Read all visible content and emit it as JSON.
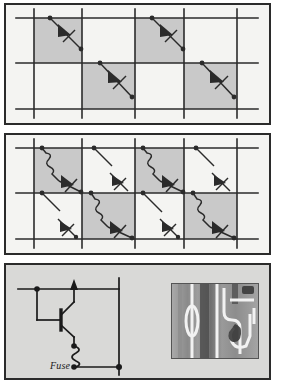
{
  "figure": {
    "title": "",
    "panels": [
      {
        "id": "panel-a",
        "name": "diode-array-grid-top",
        "description": "Rectangular grid of conductor lines with shaded cells, each crossed by a diagonal branch containing a diode symbol",
        "background_color": "#f4f4f2",
        "border_color": "#2b2b2b",
        "shade_color": "#c9c9c9",
        "line_color": "#2b2b2b",
        "grid": {
          "vertical_x": [
            32,
            80,
            133,
            182,
            235
          ],
          "horizontal_y": [
            17,
            62,
            108
          ],
          "columns": 4,
          "rows": 2
        },
        "shaded_cells": [
          {
            "col": 0,
            "row": 0
          },
          {
            "col": 2,
            "row": 0
          },
          {
            "col": 1,
            "row": 1
          },
          {
            "col": 3,
            "row": 1
          }
        ],
        "elements": [
          {
            "type": "diagonal-diode-branch",
            "col": 0,
            "row": 0,
            "symbol": "diode"
          },
          {
            "type": "diagonal-diode-branch",
            "col": 2,
            "row": 0,
            "symbol": "diode"
          },
          {
            "type": "diagonal-diode-branch",
            "col": 1,
            "row": 1,
            "symbol": "diode"
          },
          {
            "type": "diagonal-diode-branch",
            "col": 3,
            "row": 1,
            "symbol": "diode"
          }
        ]
      },
      {
        "id": "panel-b",
        "name": "diode-fuse-array-grid-middle",
        "description": "Same grid with every cell populated: shaded cells carry a wavy fuse in series with a diode, unshaded cells carry a short plain diagonal stub or a diode alone",
        "background_color": "#f4f4f2",
        "border_color": "#2b2b2b",
        "shade_color": "#c9c9c9",
        "line_color": "#2b2b2b",
        "grid": {
          "vertical_x": [
            32,
            80,
            133,
            182,
            235
          ],
          "horizontal_y": [
            17,
            62,
            108
          ],
          "columns": 4,
          "rows": 2
        },
        "shaded_cells": [
          {
            "col": 0,
            "row": 0
          },
          {
            "col": 2,
            "row": 0
          },
          {
            "col": 1,
            "row": 1
          },
          {
            "col": 3,
            "row": 1
          }
        ],
        "elements": [
          {
            "type": "fuse-diode-branch",
            "col": 0,
            "row": 0,
            "symbols": [
              "fuse",
              "diode"
            ]
          },
          {
            "type": "stub-branch",
            "col": 1,
            "row": 0,
            "symbols": []
          },
          {
            "type": "fuse-diode-branch",
            "col": 2,
            "row": 0,
            "symbols": [
              "fuse",
              "diode"
            ]
          },
          {
            "type": "stub-branch",
            "col": 3,
            "row": 0,
            "symbols": []
          },
          {
            "type": "diode-only-branch",
            "col": 1,
            "row": 0,
            "symbols": [
              "diode"
            ]
          },
          {
            "type": "diode-only-branch",
            "col": 3,
            "row": 0,
            "symbols": [
              "diode"
            ]
          },
          {
            "type": "stub-branch",
            "col": 0,
            "row": 1,
            "symbols": []
          },
          {
            "type": "fuse-diode-branch",
            "col": 1,
            "row": 1,
            "symbols": [
              "fuse",
              "diode"
            ]
          },
          {
            "type": "stub-branch",
            "col": 2,
            "row": 1,
            "symbols": []
          },
          {
            "type": "fuse-diode-branch",
            "col": 3,
            "row": 1,
            "symbols": [
              "fuse",
              "diode"
            ]
          },
          {
            "type": "diode-only-branch",
            "col": 0,
            "row": 1,
            "symbols": [
              "diode"
            ]
          },
          {
            "type": "diode-only-branch",
            "col": 2,
            "row": 1,
            "symbols": [
              "diode"
            ]
          }
        ]
      },
      {
        "id": "panel-c",
        "name": "transistor-fuse-cell-and-micrograph",
        "description": "Schematic of one memory cell: bipolar transistor with emitter in series with a fuse tied to the lower bus line, beside a grayscale micrograph of the fabricated device",
        "background_color": "#d9d9d7",
        "border_color": "#2b2b2b",
        "line_color": "#1a1a1a",
        "labels": {
          "fuse": "Fuse"
        },
        "schematic": {
          "word_line_y": 24,
          "bit_line_x": 113,
          "bottom_line_y": 100,
          "transistor_type": "npn-bipolar",
          "nodes": [
            "base-contact",
            "emitter-fuse-node",
            "bit-line-node"
          ]
        },
        "micrograph": {
          "name": "device-micrograph",
          "kind": "grayscale-sem-image",
          "width": 86,
          "height": 74
        }
      }
    ]
  }
}
